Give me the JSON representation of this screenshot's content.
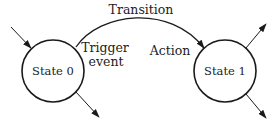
{
  "diagram": {
    "type": "state-machine",
    "states": [
      {
        "id": "s0",
        "label": "State 0"
      },
      {
        "id": "s1",
        "label": "State 1"
      }
    ],
    "transition": {
      "from": "s0",
      "to": "s1",
      "label": "Transition",
      "trigger_label_line1": "Trigger",
      "trigger_label_line2": "event",
      "action_label": "Action"
    },
    "colors": {
      "line": "#1a1a1a",
      "text": "#222222",
      "background": "#ffffff"
    }
  }
}
